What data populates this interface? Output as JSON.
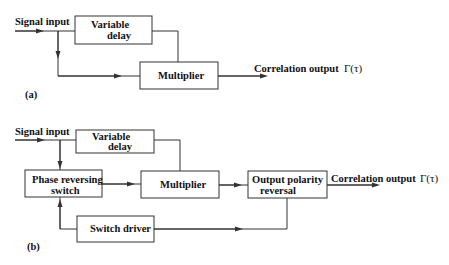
{
  "diagram": {
    "a": {
      "label": "(a)",
      "input_label": "Signal input",
      "boxes": {
        "delay": [
          "Variable",
          "delay"
        ],
        "multiplier": "Multiplier"
      },
      "output_label": "Correlation output",
      "output_symbol": "Γ(τ)"
    },
    "b": {
      "label": "(b)",
      "input_label": "Signal input",
      "boxes": {
        "delay": [
          "Variable",
          "delay"
        ],
        "phase_switch": [
          "Phase reversing",
          "switch"
        ],
        "multiplier": "Multiplier",
        "polarity": [
          "Output polarity",
          "reversal"
        ],
        "switch_driver": "Switch driver"
      },
      "output_label": "Correlation output",
      "output_symbol": "Γ(τ)"
    }
  }
}
